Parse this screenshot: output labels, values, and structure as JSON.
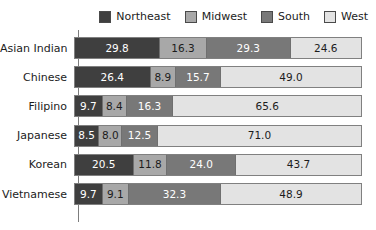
{
  "legend": {
    "position": "top-right",
    "entries": [
      {
        "label": "Northeast",
        "color": "#3f3f3f"
      },
      {
        "label": "Midwest",
        "color": "#a8a8a8"
      },
      {
        "label": "South",
        "color": "#787878"
      },
      {
        "label": "West",
        "color": "#e3e3e3"
      }
    ]
  },
  "chart_data": {
    "type": "bar",
    "orientation": "horizontal",
    "stacked": true,
    "normalized": true,
    "title": "",
    "subtitle": "",
    "xlabel": "",
    "ylabel": "",
    "xlim": [
      0,
      100
    ],
    "grid": false,
    "legend_position": "top-right",
    "categories": [
      "Asian Indian",
      "Chinese",
      "Filipino",
      "Japanese",
      "Korean",
      "Vietnamese"
    ],
    "series": [
      {
        "name": "Northeast",
        "color": "#3f3f3f",
        "values": [
          29.8,
          26.4,
          9.7,
          8.5,
          20.5,
          9.7
        ]
      },
      {
        "name": "Midwest",
        "color": "#a8a8a8",
        "values": [
          16.3,
          8.9,
          8.4,
          8.0,
          11.8,
          9.1
        ]
      },
      {
        "name": "South",
        "color": "#787878",
        "values": [
          29.3,
          15.7,
          16.3,
          12.5,
          24.0,
          32.3
        ]
      },
      {
        "name": "West",
        "color": "#e3e3e3",
        "values": [
          24.6,
          49.0,
          65.6,
          71.0,
          43.7,
          48.9
        ]
      }
    ],
    "data_labels": [
      [
        "29.8",
        "16.3",
        "29.3",
        "24.6"
      ],
      [
        "26.4",
        "8.9",
        "15.7",
        "49.0"
      ],
      [
        "9.7",
        "8.4",
        "16.3",
        "65.6"
      ],
      [
        "8.5",
        "8.0",
        "12.5",
        "71.0"
      ],
      [
        "20.5",
        "11.8",
        "24.0",
        "43.7"
      ],
      [
        "9.7",
        "9.1",
        "32.3",
        "48.9"
      ]
    ]
  }
}
